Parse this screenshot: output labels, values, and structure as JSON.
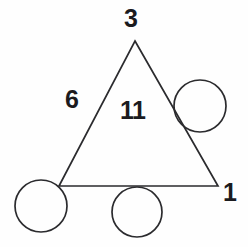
{
  "figure": {
    "background_color": "#fefefe",
    "stroke_color": "#2b2b2e",
    "text_color": "#1b1b1e",
    "stroke_width": 1.7,
    "canvas": {
      "width": 248,
      "height": 247
    }
  },
  "shapes": {
    "triangle": {
      "name": "triangle",
      "points": "135,41 218,186 59,186",
      "vertices": {
        "apex": {
          "x": 135,
          "y": 41
        },
        "bottom_left": {
          "x": 59,
          "y": 186
        },
        "bottom_right": {
          "x": 218,
          "y": 186
        }
      }
    },
    "circles": [
      {
        "name": "circle-bottom-left",
        "cx": 41,
        "cy": 206,
        "r": 26
      },
      {
        "name": "circle-bottom-center",
        "cx": 137,
        "cy": 212,
        "r": 25
      },
      {
        "name": "circle-upper-right",
        "cx": 200,
        "cy": 106,
        "r": 26
      }
    ]
  },
  "labels": {
    "top": "3",
    "left_edge": "6",
    "interior": "11",
    "bottom_right": "1"
  }
}
